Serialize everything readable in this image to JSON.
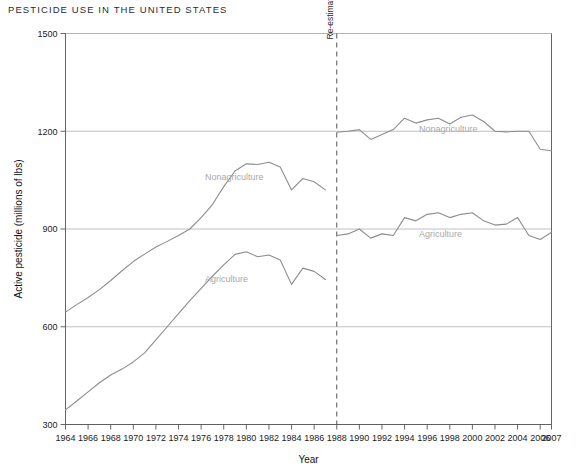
{
  "title": "PESTICIDE USE IN THE UNITED STATES",
  "axes": {
    "xlabel": "Year",
    "ylabel": "Active pesticide (millions of lbs)",
    "yticks": [
      "300",
      "600",
      "900",
      "1200",
      "1500"
    ],
    "xticks": [
      "1964",
      "1966",
      "1968",
      "1970",
      "1972",
      "1974",
      "1976",
      "1978",
      "1980",
      "1982",
      "1984",
      "1986",
      "1988",
      "1990",
      "1992",
      "1994",
      "1996",
      "1998",
      "2000",
      "2002",
      "2004",
      "2006",
      "2007"
    ]
  },
  "annotations": {
    "reestimate": "Re-estimated 1988"
  },
  "series_labels": {
    "nonag_left": "Nonagriculture",
    "ag_left": "Agriculture",
    "nonag_right": "Nonagriculture",
    "ag_right": "Agriculture"
  },
  "colors": {
    "line": "#8d8d8d",
    "grid": "#b0b0b0",
    "axis": "#555555",
    "label": "#a9a9a9"
  },
  "chart_data": {
    "type": "line",
    "title": "PESTICIDE USE IN THE UNITED STATES",
    "xlabel": "Year",
    "ylabel": "Active pesticide (millions of lbs)",
    "xlim": [
      1964,
      2007
    ],
    "ylim": [
      300,
      1500
    ],
    "yticks": [
      300,
      600,
      900,
      1200,
      1500
    ],
    "grid": true,
    "legend": "inline-labels",
    "annotation": {
      "text": "Re-estimated 1988",
      "x": 1988,
      "style": "dashed-vertical"
    },
    "series": [
      {
        "name": "Nonagriculture",
        "segment": "pre-1988",
        "x": [
          1964,
          1965,
          1966,
          1967,
          1968,
          1969,
          1970,
          1971,
          1972,
          1973,
          1974,
          1975,
          1976,
          1977,
          1978,
          1979,
          1980,
          1981,
          1982,
          1983,
          1984,
          1985,
          1986,
          1987
        ],
        "values": [
          645,
          668,
          690,
          714,
          742,
          772,
          800,
          823,
          845,
          862,
          880,
          900,
          935,
          975,
          1030,
          1078,
          1100,
          1098,
          1105,
          1090,
          1020,
          1055,
          1045,
          1020
        ]
      },
      {
        "name": "Nonagriculture",
        "segment": "post-1988",
        "x": [
          1988,
          1989,
          1990,
          1991,
          1992,
          1993,
          1994,
          1995,
          1996,
          1997,
          1998,
          1999,
          2000,
          2001,
          2002,
          2003,
          2004,
          2005,
          2006,
          2007
        ],
        "values": [
          1197,
          1200,
          1205,
          1175,
          1190,
          1205,
          1240,
          1225,
          1235,
          1240,
          1222,
          1243,
          1250,
          1230,
          1200,
          1198,
          1200,
          1200,
          1145,
          1140
        ]
      },
      {
        "name": "Agriculture",
        "segment": "pre-1988",
        "x": [
          1964,
          1965,
          1966,
          1967,
          1968,
          1969,
          1970,
          1971,
          1972,
          1973,
          1974,
          1975,
          1976,
          1977,
          1978,
          1979,
          1980,
          1981,
          1982,
          1983,
          1984,
          1985,
          1986,
          1987
        ],
        "values": [
          345,
          372,
          400,
          428,
          452,
          470,
          492,
          520,
          560,
          600,
          640,
          680,
          718,
          755,
          790,
          822,
          830,
          815,
          820,
          805,
          730,
          780,
          770,
          745
        ]
      },
      {
        "name": "Agriculture",
        "segment": "post-1988",
        "x": [
          1988,
          1989,
          1990,
          1991,
          1992,
          1993,
          1994,
          1995,
          1996,
          1997,
          1998,
          1999,
          2000,
          2001,
          2002,
          2003,
          2004,
          2005,
          2006,
          2007
        ],
        "values": [
          880,
          885,
          900,
          872,
          885,
          880,
          935,
          925,
          945,
          950,
          935,
          945,
          950,
          925,
          912,
          915,
          935,
          880,
          868,
          890
        ]
      }
    ]
  }
}
